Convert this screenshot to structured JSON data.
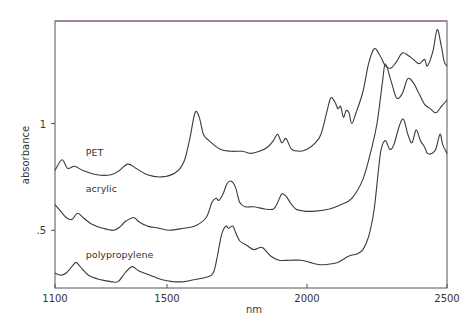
{
  "chart_data": {
    "type": "line",
    "title": "",
    "xlabel": "nm",
    "ylabel": "absorbance",
    "xlim": [
      1100,
      2500
    ],
    "ylim": [
      0.23,
      1.48
    ],
    "grid": false,
    "legend": "inline labels",
    "x_ticks": [
      {
        "value": 1100,
        "label": "1100"
      },
      {
        "value": 1500,
        "label": "1500"
      },
      {
        "value": 2000,
        "label": "2000"
      },
      {
        "value": 2500,
        "label": "2500"
      }
    ],
    "y_ticks": [
      {
        "value": 1.0,
        "label": "1"
      },
      {
        "value": 0.5,
        "label": ".5"
      }
    ],
    "series": [
      {
        "name": "PET",
        "label_pos": {
          "x": 1210,
          "y": 0.85
        },
        "points": [
          [
            1100,
            0.78
          ],
          [
            1125,
            0.83
          ],
          [
            1145,
            0.79
          ],
          [
            1170,
            0.8
          ],
          [
            1200,
            0.78
          ],
          [
            1250,
            0.76
          ],
          [
            1300,
            0.76
          ],
          [
            1330,
            0.78
          ],
          [
            1360,
            0.81
          ],
          [
            1390,
            0.79
          ],
          [
            1430,
            0.76
          ],
          [
            1480,
            0.75
          ],
          [
            1530,
            0.77
          ],
          [
            1560,
            0.82
          ],
          [
            1580,
            0.92
          ],
          [
            1600,
            1.05
          ],
          [
            1615,
            1.03
          ],
          [
            1630,
            0.95
          ],
          [
            1650,
            0.92
          ],
          [
            1690,
            0.88
          ],
          [
            1730,
            0.87
          ],
          [
            1770,
            0.87
          ],
          [
            1800,
            0.86
          ],
          [
            1830,
            0.87
          ],
          [
            1860,
            0.89
          ],
          [
            1880,
            0.92
          ],
          [
            1895,
            0.95
          ],
          [
            1910,
            0.91
          ],
          [
            1925,
            0.93
          ],
          [
            1945,
            0.88
          ],
          [
            1975,
            0.87
          ],
          [
            2000,
            0.88
          ],
          [
            2030,
            0.91
          ],
          [
            2050,
            0.95
          ],
          [
            2070,
            1.05
          ],
          [
            2085,
            1.12
          ],
          [
            2100,
            1.1
          ],
          [
            2110,
            1.07
          ],
          [
            2120,
            1.08
          ],
          [
            2130,
            1.03
          ],
          [
            2140,
            1.06
          ],
          [
            2150,
            1.05
          ],
          [
            2160,
            1.0
          ],
          [
            2175,
            1.05
          ],
          [
            2200,
            1.15
          ],
          [
            2220,
            1.28
          ],
          [
            2240,
            1.35
          ],
          [
            2260,
            1.32
          ],
          [
            2280,
            1.27
          ],
          [
            2300,
            1.26
          ],
          [
            2320,
            1.29
          ],
          [
            2340,
            1.33
          ],
          [
            2360,
            1.32
          ],
          [
            2380,
            1.3
          ],
          [
            2400,
            1.28
          ],
          [
            2420,
            1.3
          ],
          [
            2430,
            1.27
          ],
          [
            2450,
            1.34
          ],
          [
            2465,
            1.44
          ],
          [
            2480,
            1.36
          ],
          [
            2490,
            1.29
          ],
          [
            2500,
            1.27
          ]
        ]
      },
      {
        "name": "acrylic",
        "label_pos": {
          "x": 1210,
          "y": 0.68
        },
        "points": [
          [
            1100,
            0.62
          ],
          [
            1120,
            0.59
          ],
          [
            1140,
            0.56
          ],
          [
            1160,
            0.55
          ],
          [
            1180,
            0.58
          ],
          [
            1200,
            0.56
          ],
          [
            1230,
            0.53
          ],
          [
            1270,
            0.51
          ],
          [
            1310,
            0.5
          ],
          [
            1335,
            0.52
          ],
          [
            1350,
            0.54
          ],
          [
            1380,
            0.56
          ],
          [
            1400,
            0.54
          ],
          [
            1430,
            0.52
          ],
          [
            1470,
            0.51
          ],
          [
            1510,
            0.5
          ],
          [
            1560,
            0.51
          ],
          [
            1600,
            0.52
          ],
          [
            1640,
            0.56
          ],
          [
            1660,
            0.63
          ],
          [
            1675,
            0.65
          ],
          [
            1685,
            0.64
          ],
          [
            1700,
            0.67
          ],
          [
            1715,
            0.72
          ],
          [
            1730,
            0.73
          ],
          [
            1745,
            0.7
          ],
          [
            1760,
            0.63
          ],
          [
            1780,
            0.61
          ],
          [
            1810,
            0.61
          ],
          [
            1850,
            0.6
          ],
          [
            1880,
            0.6
          ],
          [
            1895,
            0.63
          ],
          [
            1910,
            0.67
          ],
          [
            1925,
            0.66
          ],
          [
            1940,
            0.63
          ],
          [
            1960,
            0.6
          ],
          [
            1990,
            0.59
          ],
          [
            2030,
            0.59
          ],
          [
            2080,
            0.6
          ],
          [
            2120,
            0.62
          ],
          [
            2160,
            0.65
          ],
          [
            2200,
            0.74
          ],
          [
            2230,
            0.88
          ],
          [
            2250,
            1.0
          ],
          [
            2270,
            1.2
          ],
          [
            2280,
            1.28
          ],
          [
            2300,
            1.2
          ],
          [
            2320,
            1.12
          ],
          [
            2340,
            1.14
          ],
          [
            2360,
            1.21
          ],
          [
            2380,
            1.19
          ],
          [
            2400,
            1.14
          ],
          [
            2420,
            1.09
          ],
          [
            2440,
            1.07
          ],
          [
            2460,
            1.05
          ],
          [
            2480,
            1.08
          ],
          [
            2500,
            1.11
          ]
        ]
      },
      {
        "name": "polypropylene",
        "label_pos": {
          "x": 1210,
          "y": 0.37
        },
        "points": [
          [
            1100,
            0.3
          ],
          [
            1120,
            0.29
          ],
          [
            1140,
            0.3
          ],
          [
            1160,
            0.33
          ],
          [
            1175,
            0.35
          ],
          [
            1190,
            0.33
          ],
          [
            1220,
            0.29
          ],
          [
            1260,
            0.27
          ],
          [
            1300,
            0.26
          ],
          [
            1325,
            0.26
          ],
          [
            1350,
            0.3
          ],
          [
            1375,
            0.33
          ],
          [
            1400,
            0.31
          ],
          [
            1440,
            0.29
          ],
          [
            1480,
            0.27
          ],
          [
            1520,
            0.26
          ],
          [
            1560,
            0.26
          ],
          [
            1600,
            0.27
          ],
          [
            1640,
            0.28
          ],
          [
            1665,
            0.3
          ],
          [
            1680,
            0.38
          ],
          [
            1695,
            0.48
          ],
          [
            1710,
            0.52
          ],
          [
            1720,
            0.51
          ],
          [
            1735,
            0.52
          ],
          [
            1745,
            0.49
          ],
          [
            1760,
            0.45
          ],
          [
            1785,
            0.43
          ],
          [
            1810,
            0.41
          ],
          [
            1840,
            0.42
          ],
          [
            1870,
            0.38
          ],
          [
            1900,
            0.36
          ],
          [
            1940,
            0.36
          ],
          [
            1980,
            0.36
          ],
          [
            2010,
            0.35
          ],
          [
            2040,
            0.34
          ],
          [
            2070,
            0.34
          ],
          [
            2110,
            0.35
          ],
          [
            2150,
            0.38
          ],
          [
            2180,
            0.39
          ],
          [
            2200,
            0.41
          ],
          [
            2220,
            0.47
          ],
          [
            2240,
            0.6
          ],
          [
            2255,
            0.78
          ],
          [
            2265,
            0.88
          ],
          [
            2280,
            0.92
          ],
          [
            2295,
            0.88
          ],
          [
            2310,
            0.9
          ],
          [
            2330,
            0.99
          ],
          [
            2345,
            1.02
          ],
          [
            2360,
            0.95
          ],
          [
            2375,
            0.91
          ],
          [
            2390,
            0.97
          ],
          [
            2405,
            0.92
          ],
          [
            2420,
            0.89
          ],
          [
            2430,
            0.86
          ],
          [
            2445,
            0.86
          ],
          [
            2460,
            0.88
          ],
          [
            2475,
            0.95
          ],
          [
            2485,
            0.9
          ],
          [
            2500,
            0.86
          ]
        ]
      }
    ]
  }
}
